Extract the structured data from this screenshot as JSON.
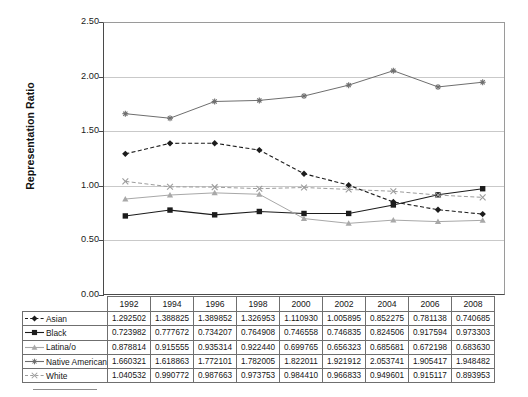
{
  "chart_data": {
    "type": "line",
    "title": "",
    "xlabel": "",
    "ylabel": "Representation Ratio",
    "ylim": [
      0.0,
      2.5
    ],
    "ytick_step": 0.5,
    "ytick_labels": [
      "0.00",
      "0.50",
      "1.00",
      "1.50",
      "2.00",
      "2.50"
    ],
    "grid": "horizontal",
    "legend_position": "table-row-labels",
    "categories": [
      "1992",
      "1994",
      "1996",
      "1998",
      "2000",
      "2002",
      "2004",
      "2006",
      "2008"
    ],
    "series": [
      {
        "name": "Asian",
        "marker": "diamond",
        "linestyle": "dashed",
        "color": "#1c1c1c",
        "values": [
          1.292502,
          1.388825,
          1.389852,
          1.326953,
          1.11093,
          1.005895,
          0.852275,
          0.781138,
          0.740685
        ],
        "labels": [
          "1.292502",
          "1.388825",
          "1.389852",
          "1.326953",
          "1.110930",
          "1.005895",
          "0.852275",
          "0.781138",
          "0.740685"
        ]
      },
      {
        "name": "Black",
        "marker": "square",
        "linestyle": "solid",
        "color": "#1c1c1c",
        "values": [
          0.723982,
          0.777672,
          0.734207,
          0.764908,
          0.746558,
          0.746835,
          0.824506,
          0.917594,
          0.973303
        ],
        "labels": [
          "0.723982",
          "0.777672",
          "0.734207",
          "0.764908",
          "0.746558",
          "0.746835",
          "0.824506",
          "0.917594",
          "0.973303"
        ]
      },
      {
        "name": "Latina/o",
        "marker": "triangle",
        "linestyle": "solid",
        "color": "#a8a8a8",
        "values": [
          0.878814,
          0.915555,
          0.935314,
          0.92244,
          0.699765,
          0.656323,
          0.685681,
          0.672198,
          0.68363
        ],
        "labels": [
          "0.878814",
          "0.915555",
          "0.935314",
          "0.922440",
          "0.699765",
          "0.656323",
          "0.685681",
          "0.672198",
          "0.683630"
        ]
      },
      {
        "name": "Native American",
        "marker": "star",
        "linestyle": "solid",
        "color": "#6e6e6e",
        "values": [
          1.660321,
          1.618863,
          1.772101,
          1.782005,
          1.822011,
          1.921912,
          2.053741,
          1.905417,
          1.948482
        ],
        "labels": [
          "1.660321",
          "1.618863",
          "1.772101",
          "1.782005",
          "1.822011",
          "1.921912",
          "2.053741",
          "1.905417",
          "1.948482"
        ]
      },
      {
        "name": "White",
        "marker": "cross",
        "linestyle": "dashed",
        "color": "#9c9c9c",
        "values": [
          1.040532,
          0.990772,
          0.987663,
          0.973753,
          0.98441,
          0.966833,
          0.949601,
          0.915117,
          0.893953
        ],
        "labels": [
          "1.040532",
          "0.990772",
          "0.987663",
          "0.973753",
          "0.984410",
          "0.966833",
          "0.949601",
          "0.915117",
          "0.893953"
        ]
      }
    ]
  }
}
